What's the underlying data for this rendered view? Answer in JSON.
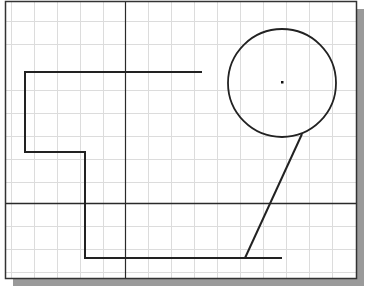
{
  "drawing": {
    "frame": {
      "x": 5,
      "y": 1,
      "width": 351,
      "height": 277,
      "stroke": "#333333"
    },
    "shadow": {
      "offset": 8,
      "color": "#9a9a9a"
    },
    "grid": {
      "color": "#dcdcdc",
      "vertical": [
        11,
        34,
        57,
        80,
        103,
        148,
        171,
        194,
        217,
        240,
        263,
        286,
        309,
        332
      ],
      "horizontal": [
        21,
        44,
        90,
        113,
        136,
        159,
        182,
        226,
        249,
        272
      ]
    },
    "axes": {
      "color": "#2a2a2a",
      "vertical_x": 125,
      "horizontal_y": 203
    },
    "polyline": {
      "color": "#222222",
      "points": "202,72 25,72 25,152 85,152 85,258 282,258"
    },
    "circle": {
      "cx": 282,
      "cy": 83,
      "r": 54,
      "color": "#222222"
    },
    "center_point": {
      "x": 282,
      "y": 82
    },
    "slant_line": {
      "x1": 302,
      "y1": 134,
      "x2": 245,
      "y2": 258,
      "color": "#222222"
    }
  }
}
